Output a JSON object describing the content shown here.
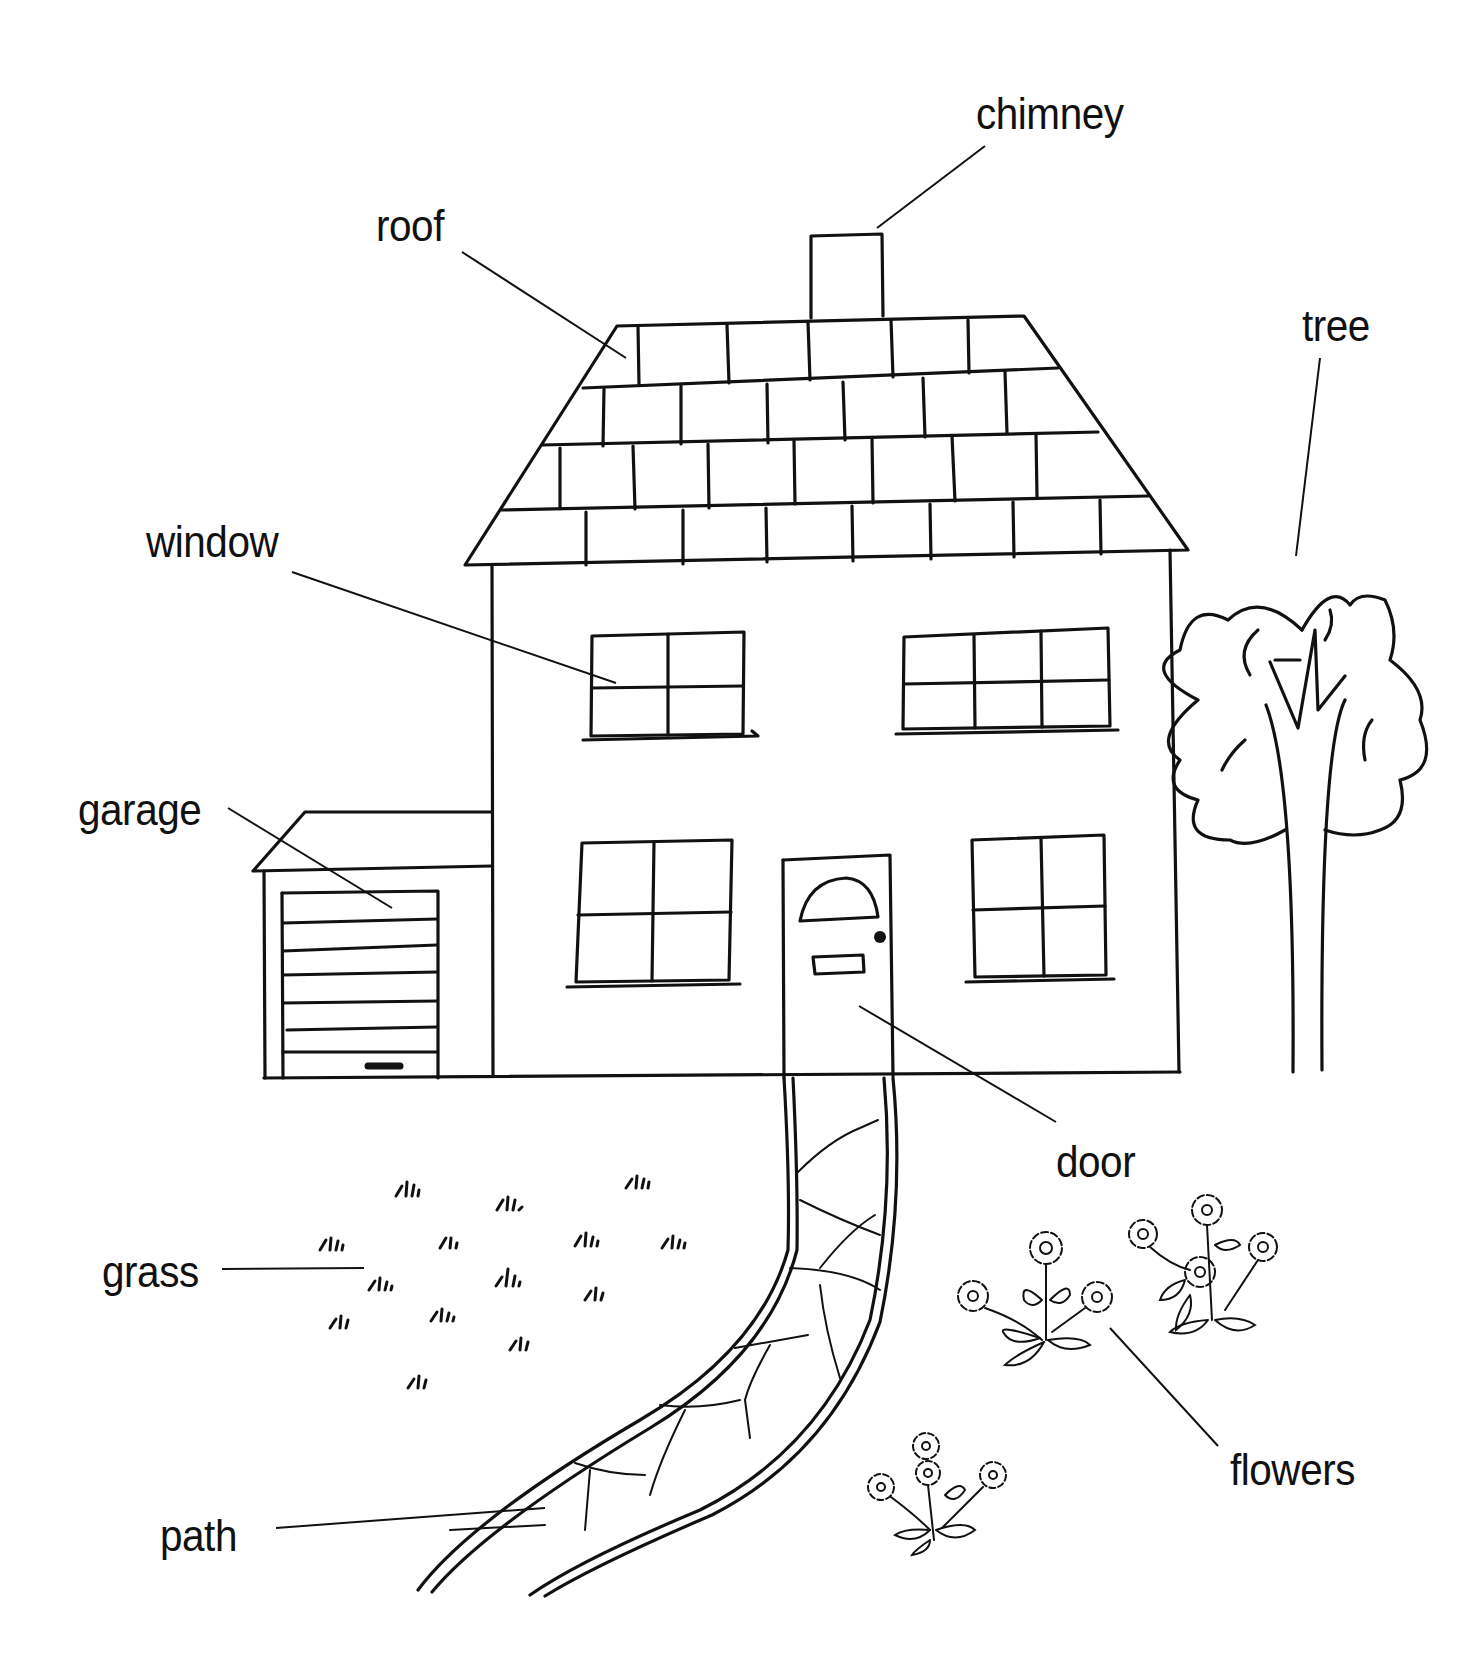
{
  "diagram": {
    "labels": [
      {
        "id": "chimney",
        "text": "chimney",
        "x": 976,
        "y": 92
      },
      {
        "id": "roof",
        "text": "roof",
        "x": 376,
        "y": 204
      },
      {
        "id": "tree",
        "text": "tree",
        "x": 1302,
        "y": 304
      },
      {
        "id": "window",
        "text": "window",
        "x": 146,
        "y": 520
      },
      {
        "id": "garage",
        "text": "garage",
        "x": 78,
        "y": 788
      },
      {
        "id": "door",
        "text": "door",
        "x": 1056,
        "y": 1140
      },
      {
        "id": "grass",
        "text": "grass",
        "x": 102,
        "y": 1250
      },
      {
        "id": "flowers",
        "text": "flowers",
        "x": 1230,
        "y": 1448
      },
      {
        "id": "path",
        "text": "path",
        "x": 160,
        "y": 1514
      }
    ]
  }
}
